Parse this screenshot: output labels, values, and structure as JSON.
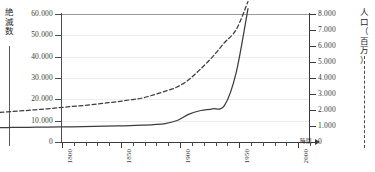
{
  "axes": {
    "left": {
      "caption_chars": [
        "絶",
        "滅",
        "数"
      ],
      "caption_text": "絶滅数",
      "ticks": [
        "0",
        "10.000",
        "20.000",
        "30.000",
        "40.000",
        "50.000",
        "60.000"
      ],
      "min": 0,
      "max": 60000,
      "step": 10000,
      "legend_style": "solid"
    },
    "right": {
      "caption_chars": [
        "人",
        "口",
        "（",
        "百",
        "万",
        "）"
      ],
      "caption_text": "人口（百万）",
      "ticks": [
        "0",
        "1.000",
        "2.000",
        "3.000",
        "4.000",
        "5.000",
        "6.000",
        "7.000",
        "8.000"
      ],
      "min": 0,
      "max": 8000,
      "step": 1000,
      "legend_style": "dashed"
    },
    "bottom": {
      "title": "時間",
      "labels": [
        "1800",
        "1850",
        "1900",
        "1950",
        "2000"
      ],
      "label_years": [
        1800,
        1850,
        1900,
        1950,
        2000
      ],
      "tick_start": 1800,
      "tick_end": 2010,
      "tick_interval": 10
    }
  },
  "colors": {
    "extinction_line": "#3d3d3d",
    "population_line": "#3d3d3d",
    "gridline": "#ececec",
    "axis": "#3b3b3b",
    "background": "#ffffff"
  },
  "chart_data": {
    "type": "line",
    "title": "",
    "xlabel": "時間",
    "ylabel": "絶滅数",
    "y2label": "人口（百万）",
    "xlim": [
      1800,
      2010
    ],
    "ylim": [
      0,
      60000
    ],
    "y2lim": [
      0,
      8000
    ],
    "grid": true,
    "legend_position": "axis-captions",
    "x": [
      1800,
      1810,
      1820,
      1830,
      1840,
      1850,
      1860,
      1870,
      1880,
      1890,
      1900,
      1910,
      1920,
      1930,
      1940,
      1950,
      1960,
      1970,
      1980,
      1990,
      2000,
      2010
    ],
    "series": [
      {
        "name": "絶滅数",
        "axis": "left",
        "style": "solid",
        "values": [
          200,
          250,
          300,
          360,
          420,
          500,
          580,
          660,
          750,
          850,
          950,
          1100,
          1300,
          1600,
          2100,
          3500,
          6500,
          8200,
          9000,
          10500,
          26000,
          56000
        ]
      },
      {
        "name": "人口（百万）",
        "axis": "right",
        "style": "dashed",
        "values": [
          980,
          1030,
          1080,
          1140,
          1200,
          1270,
          1340,
          1400,
          1480,
          1570,
          1650,
          1760,
          1860,
          2070,
          2300,
          2560,
          3030,
          3700,
          4450,
          5330,
          6150,
          7900
        ]
      }
    ]
  }
}
